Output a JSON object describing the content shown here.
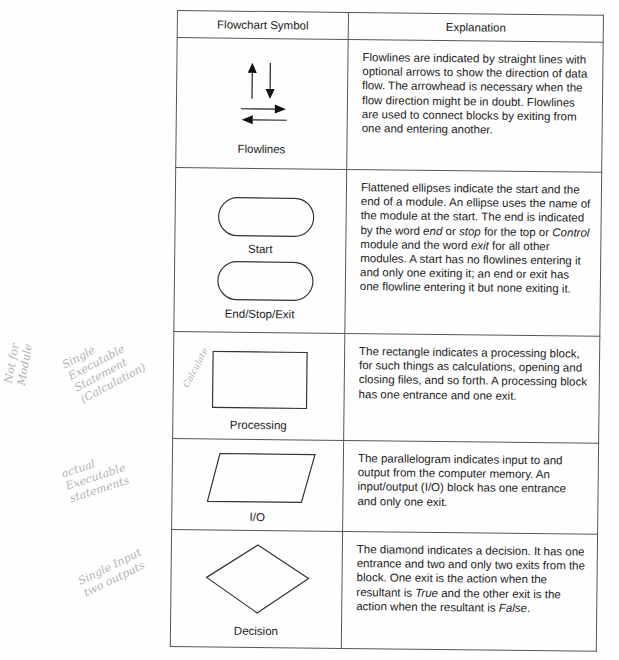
{
  "table": {
    "headers": {
      "symbol": "Flowchart Symbol",
      "explanation": "Explanation"
    },
    "rows": [
      {
        "symbol_labels": [
          "Flowlines"
        ],
        "icon": "flowline-arrows-icon",
        "explanation": [
          {
            "t": "Flowlines are indicated by straight lines with optional arrows to show the direction of data flow. The arrowhead is necessary when the flow direction might be in doubt. Flowlines are used to connect blocks by exiting from one and entering another."
          }
        ]
      },
      {
        "symbol_labels": [
          "Start",
          "End/Stop/Exit"
        ],
        "icon": "terminal-ellipse-icon",
        "explanation": [
          {
            "t": "Flattened ellipses indicate the start and the end of a module. An ellipse uses the name of the module at the start. The end is indicated by the word "
          },
          {
            "t": "end",
            "i": true
          },
          {
            "t": " or "
          },
          {
            "t": "stop",
            "i": true
          },
          {
            "t": " for the top or "
          },
          {
            "t": "Control",
            "i": true
          },
          {
            "t": " module and the word "
          },
          {
            "t": "exit",
            "i": true
          },
          {
            "t": " for all other modules. A start has no flowlines entering it and only one exiting it; an end or exit has one flowline entering it but none exiting it."
          }
        ]
      },
      {
        "symbol_labels": [
          "Processing"
        ],
        "icon": "rectangle-icon",
        "explanation": [
          {
            "t": "The rectangle indicates a processing block, for such things as calculations, opening and closing files, and so forth. A processing block has one entrance and one exit."
          }
        ]
      },
      {
        "symbol_labels": [
          "I/O"
        ],
        "icon": "parallelogram-icon",
        "explanation": [
          {
            "t": "The parallelogram indicates input to and output from the computer memory. An input/output (I/O) block has one entrance and only one exit."
          }
        ]
      },
      {
        "symbol_labels": [
          "Decision"
        ],
        "icon": "diamond-icon",
        "explanation": [
          {
            "t": "The diamond indicates a decision. It has one entrance and two and only two exits from the block. One exit is the action when the resultant is "
          },
          {
            "t": "True",
            "i": true
          },
          {
            "t": " and the other exit is the action when the resultant is "
          },
          {
            "t": "False",
            "i": true
          },
          {
            "t": "."
          }
        ]
      }
    ]
  },
  "handwritten_notes": {
    "not_for_module": "Not for\nModule",
    "single_executable": "Single\nExecutable\nStatement\n(Calculation)",
    "calculate": "Calculate",
    "actual_executable": "actual\nExecutable\nstatements",
    "single_input": "Single Input\ntwo outputs"
  },
  "colors": {
    "ink": "#1a1a1a",
    "border": "#555555",
    "pencil": "#9a9a9a"
  }
}
